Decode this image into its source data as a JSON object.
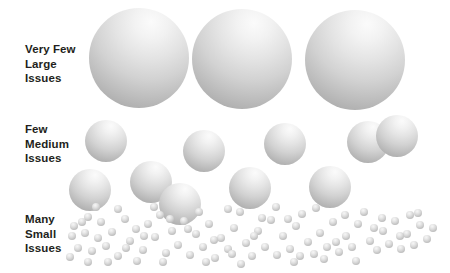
{
  "diagram": {
    "width": 450,
    "height": 273,
    "background_color": "#ffffff"
  },
  "labels": {
    "large": "Very Few\nLarge\nIssues",
    "medium": "Few\nMedium\nIssues",
    "small": "Many\nSmall\nIssues",
    "text_color": "#231f20"
  },
  "chart_data": {
    "type": "scatter",
    "xlabel": "",
    "ylabel": "",
    "grid": false,
    "legend": "none",
    "series": [
      {
        "name": "Very Few Large Issues",
        "label": "Very Few\nLarge\nIssues",
        "count": 3,
        "diameter": 100,
        "fill": "#d2d2d2",
        "points": [
          {
            "cx": 139,
            "cy": 58,
            "r": 50
          },
          {
            "cx": 242,
            "cy": 59,
            "r": 50
          },
          {
            "cx": 355,
            "cy": 60,
            "r": 50
          }
        ]
      },
      {
        "name": "Few Medium Issues",
        "label": "Few\nMedium\nIssues",
        "count": 10,
        "diameter": 42,
        "fill": "#d2d2d2",
        "points": [
          {
            "cx": 106,
            "cy": 141,
            "r": 21
          },
          {
            "cx": 90,
            "cy": 190,
            "r": 21
          },
          {
            "cx": 151,
            "cy": 182,
            "r": 21
          },
          {
            "cx": 204,
            "cy": 151,
            "r": 21
          },
          {
            "cx": 250,
            "cy": 188,
            "r": 21
          },
          {
            "cx": 285,
            "cy": 144,
            "r": 21
          },
          {
            "cx": 330,
            "cy": 187,
            "r": 21
          },
          {
            "cx": 368,
            "cy": 142,
            "r": 21
          },
          {
            "cx": 180,
            "cy": 204,
            "r": 21
          },
          {
            "cx": 397,
            "cy": 136,
            "r": 21
          }
        ]
      },
      {
        "name": "Many Small Issues",
        "label": "Many\nSmall\nIssues",
        "count": 96,
        "diameter": 8,
        "fill": "#cfcfcf",
        "points": [
          {
            "cx": 74,
            "cy": 226,
            "r": 4.0
          },
          {
            "cx": 88,
            "cy": 217,
            "r": 4.0
          },
          {
            "cx": 101,
            "cy": 222,
            "r": 4.0
          },
          {
            "cx": 72,
            "cy": 236,
            "r": 4.0
          },
          {
            "cx": 85,
            "cy": 233,
            "r": 4.0
          },
          {
            "cx": 98,
            "cy": 238,
            "r": 4.0
          },
          {
            "cx": 78,
            "cy": 248,
            "r": 4.0
          },
          {
            "cx": 92,
            "cy": 251,
            "r": 4.0
          },
          {
            "cx": 106,
            "cy": 246,
            "r": 4.0
          },
          {
            "cx": 70,
            "cy": 257,
            "r": 4.0
          },
          {
            "cx": 88,
            "cy": 262,
            "r": 4.0
          },
          {
            "cx": 112,
            "cy": 232,
            "r": 4.0
          },
          {
            "cx": 118,
            "cy": 256,
            "r": 4.0
          },
          {
            "cx": 125,
            "cy": 219,
            "r": 4.0
          },
          {
            "cx": 130,
            "cy": 241,
            "r": 4.0
          },
          {
            "cx": 136,
            "cy": 229,
            "r": 4.0
          },
          {
            "cx": 143,
            "cy": 250,
            "r": 4.0
          },
          {
            "cx": 148,
            "cy": 224,
            "r": 4.0
          },
          {
            "cx": 155,
            "cy": 237,
            "r": 4.0
          },
          {
            "cx": 160,
            "cy": 215,
            "r": 4.0
          },
          {
            "cx": 166,
            "cy": 253,
            "r": 4.0
          },
          {
            "cx": 172,
            "cy": 231,
            "r": 4.0
          },
          {
            "cx": 178,
            "cy": 245,
            "r": 4.0
          },
          {
            "cx": 184,
            "cy": 221,
            "r": 4.0
          },
          {
            "cx": 190,
            "cy": 255,
            "r": 4.0
          },
          {
            "cx": 196,
            "cy": 234,
            "r": 4.0
          },
          {
            "cx": 203,
            "cy": 247,
            "r": 4.0
          },
          {
            "cx": 209,
            "cy": 224,
            "r": 4.0
          },
          {
            "cx": 215,
            "cy": 258,
            "r": 4.0
          },
          {
            "cx": 221,
            "cy": 238,
            "r": 4.0
          },
          {
            "cx": 228,
            "cy": 249,
            "r": 4.0
          },
          {
            "cx": 234,
            "cy": 228,
            "r": 4.0
          },
          {
            "cx": 240,
            "cy": 212,
            "r": 4.0
          },
          {
            "cx": 246,
            "cy": 243,
            "r": 4.0
          },
          {
            "cx": 252,
            "cy": 256,
            "r": 4.0
          },
          {
            "cx": 258,
            "cy": 231,
            "r": 4.0
          },
          {
            "cx": 265,
            "cy": 247,
            "r": 4.0
          },
          {
            "cx": 271,
            "cy": 220,
            "r": 4.0
          },
          {
            "cx": 277,
            "cy": 255,
            "r": 4.0
          },
          {
            "cx": 283,
            "cy": 236,
            "r": 4.0
          },
          {
            "cx": 290,
            "cy": 249,
            "r": 4.0
          },
          {
            "cx": 296,
            "cy": 226,
            "r": 4.0
          },
          {
            "cx": 302,
            "cy": 214,
            "r": 4.0
          },
          {
            "cx": 308,
            "cy": 242,
            "r": 4.0
          },
          {
            "cx": 314,
            "cy": 254,
            "r": 4.0
          },
          {
            "cx": 320,
            "cy": 233,
            "r": 4.0
          },
          {
            "cx": 327,
            "cy": 247,
            "r": 4.0
          },
          {
            "cx": 333,
            "cy": 222,
            "r": 4.0
          },
          {
            "cx": 339,
            "cy": 252,
            "r": 4.0
          },
          {
            "cx": 346,
            "cy": 236,
            "r": 4.0
          },
          {
            "cx": 352,
            "cy": 247,
            "r": 4.0
          },
          {
            "cx": 358,
            "cy": 224,
            "r": 4.0
          },
          {
            "cx": 364,
            "cy": 212,
            "r": 4.0
          },
          {
            "cx": 370,
            "cy": 241,
            "r": 4.0
          },
          {
            "cx": 377,
            "cy": 250,
            "r": 4.0
          },
          {
            "cx": 383,
            "cy": 231,
            "r": 4.0
          },
          {
            "cx": 389,
            "cy": 244,
            "r": 4.0
          },
          {
            "cx": 395,
            "cy": 221,
            "r": 4.0
          },
          {
            "cx": 401,
            "cy": 249,
            "r": 4.0
          },
          {
            "cx": 407,
            "cy": 234,
            "r": 4.0
          },
          {
            "cx": 414,
            "cy": 245,
            "r": 4.0
          },
          {
            "cx": 420,
            "cy": 225,
            "r": 4.0
          },
          {
            "cx": 427,
            "cy": 239,
            "r": 4.0
          },
          {
            "cx": 433,
            "cy": 228,
            "r": 4.0
          },
          {
            "cx": 118,
            "cy": 209,
            "r": 4.0
          },
          {
            "cx": 154,
            "cy": 207,
            "r": 4.0
          },
          {
            "cx": 228,
            "cy": 209,
            "r": 4.0
          },
          {
            "cx": 276,
            "cy": 207,
            "r": 4.0
          },
          {
            "cx": 316,
            "cy": 208,
            "r": 4.0
          },
          {
            "cx": 96,
            "cy": 207,
            "r": 4.0
          },
          {
            "cx": 137,
            "cy": 261,
            "r": 4.0
          },
          {
            "cx": 199,
            "cy": 212,
            "r": 4.0
          },
          {
            "cx": 262,
            "cy": 218,
            "r": 4.0
          },
          {
            "cx": 345,
            "cy": 215,
            "r": 4.0
          },
          {
            "cx": 382,
            "cy": 218,
            "r": 4.0
          },
          {
            "cx": 418,
            "cy": 213,
            "r": 4.0
          },
          {
            "cx": 108,
            "cy": 262,
            "r": 4.0
          },
          {
            "cx": 163,
            "cy": 262,
            "r": 4.0
          },
          {
            "cx": 206,
            "cy": 262,
            "r": 4.0
          },
          {
            "cx": 241,
            "cy": 264,
            "r": 4.0
          },
          {
            "cx": 294,
            "cy": 262,
            "r": 4.0
          },
          {
            "cx": 356,
            "cy": 261,
            "r": 4.0
          },
          {
            "cx": 126,
            "cy": 248,
            "r": 4.0
          },
          {
            "cx": 170,
            "cy": 219,
            "r": 4.0
          },
          {
            "cx": 214,
            "cy": 240,
            "r": 4.0
          },
          {
            "cx": 254,
            "cy": 236,
            "r": 4.0
          },
          {
            "cx": 300,
            "cy": 256,
            "r": 4.0
          },
          {
            "cx": 336,
            "cy": 242,
            "r": 4.0
          },
          {
            "cx": 374,
            "cy": 228,
            "r": 4.0
          },
          {
            "cx": 410,
            "cy": 215,
            "r": 4.0
          },
          {
            "cx": 82,
            "cy": 222,
            "r": 4.0
          },
          {
            "cx": 144,
            "cy": 236,
            "r": 4.0
          },
          {
            "cx": 188,
            "cy": 229,
            "r": 4.0
          },
          {
            "cx": 232,
            "cy": 254,
            "r": 4.0
          },
          {
            "cx": 288,
            "cy": 219,
            "r": 4.0
          },
          {
            "cx": 324,
            "cy": 259,
            "r": 4.0
          },
          {
            "cx": 400,
            "cy": 236,
            "r": 4.0
          }
        ]
      }
    ]
  }
}
